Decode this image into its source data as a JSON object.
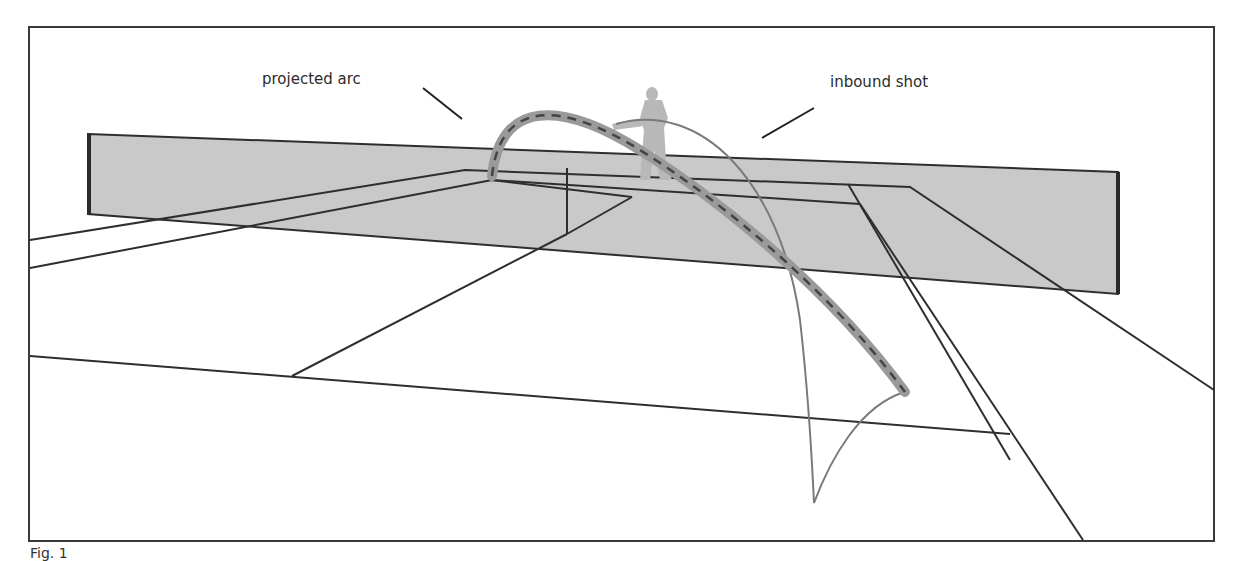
{
  "figure": {
    "labels": {
      "projected_arc": "projected arc",
      "inbound_shot": "inbound shot"
    },
    "caption": "Fig. 1",
    "colors": {
      "frame": "#3a3a3a",
      "net_fill": "#c9c9c9",
      "court_lines": "#2e2e2e",
      "projected_arc_band": "#9a9a9a",
      "projected_arc_dash": "#444444",
      "inbound_shot": "#7a7a7a",
      "player": "#b5b5b5"
    }
  }
}
